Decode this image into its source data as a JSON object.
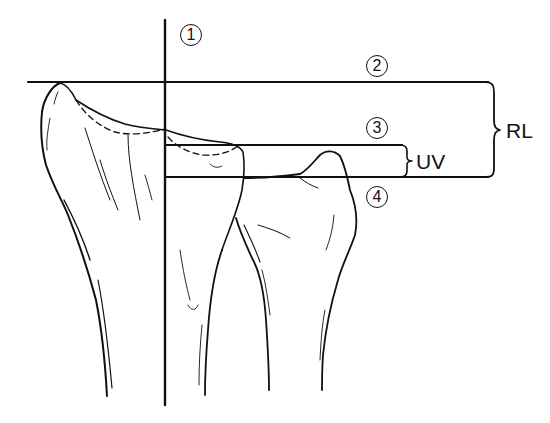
{
  "diagram": {
    "lines": [
      {
        "id": 1,
        "marker": "1",
        "orientation": "vertical",
        "description": "Long axis line of radius"
      },
      {
        "id": 2,
        "marker": "2",
        "orientation": "horizontal",
        "description": "Line at tip of radial styloid"
      },
      {
        "id": 3,
        "marker": "3",
        "orientation": "horizontal",
        "description": "Line at ulnar corner of radial articular surface"
      },
      {
        "id": 4,
        "marker": "4",
        "orientation": "horizontal",
        "description": "Line at ulnar head articular surface"
      }
    ],
    "measurements": [
      {
        "label": "RL",
        "between": [
          2,
          4
        ]
      },
      {
        "label": "UV",
        "between": [
          3,
          4
        ]
      }
    ]
  },
  "labels": {
    "m1": "1",
    "m2": "2",
    "m3": "3",
    "m4": "4",
    "rl": "RL",
    "uv": "UV"
  },
  "colors": {
    "ink": "#111111",
    "background": "#ffffff"
  }
}
